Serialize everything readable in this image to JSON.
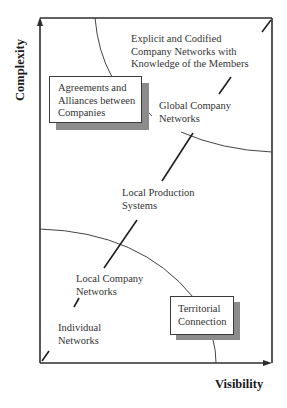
{
  "axes": {
    "y_label": "Complexity",
    "x_label": "Visibility"
  },
  "boxes": [
    {
      "id": "agreements",
      "lines": [
        "Agreements and",
        "Alliances between",
        "Companies"
      ]
    },
    {
      "id": "territorial",
      "lines": [
        "Territorial",
        "Connection"
      ]
    }
  ],
  "labels": [
    {
      "id": "explicit",
      "lines": [
        "Explicit and Codified",
        "Company Networks with",
        "Knowledge of the Members"
      ]
    },
    {
      "id": "global",
      "lines": [
        "Global Company",
        "Networks"
      ]
    },
    {
      "id": "local-production",
      "lines": [
        "Local Production",
        "Systems"
      ]
    },
    {
      "id": "local-company",
      "lines": [
        "Local Company",
        "Networks"
      ]
    },
    {
      "id": "individual",
      "lines": [
        "Individual",
        "Networks"
      ]
    }
  ],
  "colors": {
    "line": "#2e2e2e",
    "shadow": "#8c8c8c",
    "background": "#ffffff"
  }
}
